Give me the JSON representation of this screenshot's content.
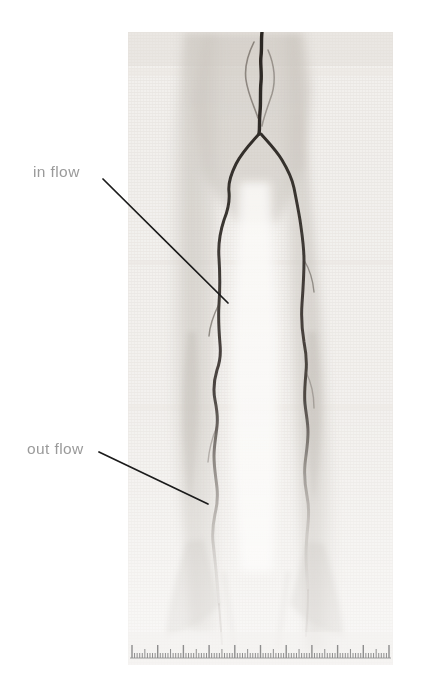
{
  "figure": {
    "background_color": "#ffffff",
    "width": 423,
    "height": 688
  },
  "film": {
    "name": "angiogram-film",
    "left": 128,
    "top": 32,
    "width": 265,
    "height": 633,
    "base_color": "#f1efec",
    "texture": "fine-grid-scan-weave",
    "modality": "x-ray-angiogram"
  },
  "annotations": [
    {
      "id": "in-flow",
      "label": "in flow",
      "text_color": "#9a9a9a",
      "leader_color": "#1b1b1b",
      "leader_start": {
        "x": 103,
        "y": 179
      },
      "leader_end": {
        "x": 228,
        "y": 303
      }
    },
    {
      "id": "out-flow",
      "label": "out flow",
      "text_color": "#9a9a9a",
      "leader_color": "#1b1b1b",
      "leader_start": {
        "x": 99,
        "y": 452
      },
      "leader_end": {
        "x": 208,
        "y": 504
      }
    }
  ],
  "vessels": {
    "stroke_color": "#2b2520",
    "description": "bilateral lower-limb arterial tree with proximal bifurcation",
    "left_branch_label": "left limb vessel",
    "right_branch_label": "right limb vessel"
  },
  "ruler": {
    "name": "measurement-ruler",
    "position": "bottom",
    "tick_color": "#8d8d8d",
    "minor_tick_count": 100,
    "major_every": 5,
    "extra_major_every": 10
  }
}
